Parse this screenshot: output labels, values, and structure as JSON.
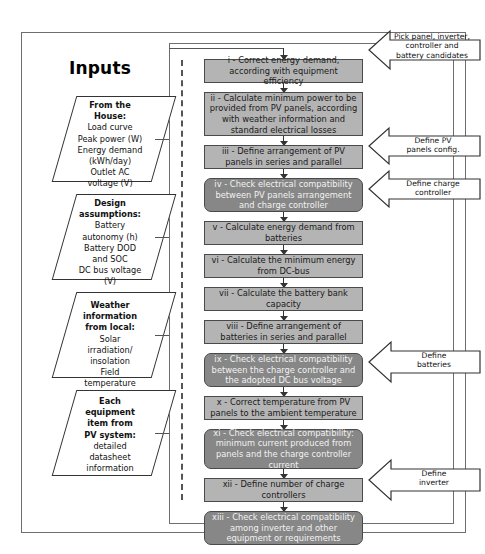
{
  "diagram": {
    "title": "Inputs",
    "inputs": [
      {
        "id": "from-the-house",
        "heading": "From the\nHouse:",
        "lines": [
          "Load curve",
          "Peak power (W)",
          "Energy demand",
          "(kWh/day)",
          "Outlet AC",
          "voltage (V)"
        ]
      },
      {
        "id": "design-assumptions",
        "heading": "Design\nassumptions:",
        "lines": [
          "Battery",
          "autonomy (h)",
          "Battery DOD",
          "and SOC",
          "DC bus voltage",
          "(V)"
        ]
      },
      {
        "id": "weather-information",
        "heading": "Weather\ninformation\nfrom local:",
        "lines": [
          "Solar",
          "irradiation/",
          "insolation",
          "Field",
          "temperature"
        ]
      },
      {
        "id": "equipment-datasheet",
        "heading": "Each\nequipment\nitem from\nPV system:",
        "lines": [
          "detailed",
          "datasheet",
          "information"
        ]
      }
    ],
    "steps": [
      {
        "id": "step-i",
        "label": "i - Correct energy demand, according with equipment efficiency",
        "type": "process"
      },
      {
        "id": "step-ii",
        "label": "ii - Calculate minimum power to be provided from PV panels, according with weather information and standard electrical losses",
        "type": "process"
      },
      {
        "id": "step-iii",
        "label": "iii - Define arrangement of PV panels in series and parallel",
        "type": "process"
      },
      {
        "id": "step-iv",
        "label": "iv - Check electrical compatibility between PV panels arrangement and charge controller",
        "type": "check"
      },
      {
        "id": "step-v",
        "label": "v - Calculate energy demand from batteries",
        "type": "process"
      },
      {
        "id": "step-vi",
        "label": "vi - Calculate the minimum energy from DC-bus",
        "type": "process"
      },
      {
        "id": "step-vii",
        "label": "vii - Calculate the battery bank capacity",
        "type": "process"
      },
      {
        "id": "step-viii",
        "label": "viii - Define arrangement of batteries in series and parallel",
        "type": "process"
      },
      {
        "id": "step-ix",
        "label": "ix - Check electrical compatibility between the charge controller  and the adopted DC bus voltage",
        "type": "check"
      },
      {
        "id": "step-x",
        "label": "x - Correct temperature from PV panels to the ambient temperature",
        "type": "process"
      },
      {
        "id": "step-xi",
        "label": "xi - Check electrical compatibility: minimum current produced from panels and the charge controller current",
        "type": "check"
      },
      {
        "id": "step-xii",
        "label": "xii - Define number of charge controllers",
        "type": "process"
      },
      {
        "id": "step-xiii",
        "label": "xiii - Check electrical compatibility among inverter and other equipment or requirements",
        "type": "check"
      }
    ],
    "callouts": [
      {
        "id": "callout-pick-candidates",
        "label": "Pick panel, inverter,\ncontroller and\nbattery candidates"
      },
      {
        "id": "callout-define-pv-panels",
        "label": "Define PV\npanels config."
      },
      {
        "id": "callout-define-charge-controller",
        "label": "Define charge\ncontroller"
      },
      {
        "id": "callout-define-batteries",
        "label": "Define\nbatteries"
      },
      {
        "id": "callout-define-inverter",
        "label": "Define\ninverter"
      }
    ],
    "colors": {
      "process_fill": "#b4b4b4",
      "check_fill": "#878787",
      "stroke": "#4a4a4a",
      "frame": "#6e6e6e",
      "page_bg": "#ffffff"
    }
  }
}
